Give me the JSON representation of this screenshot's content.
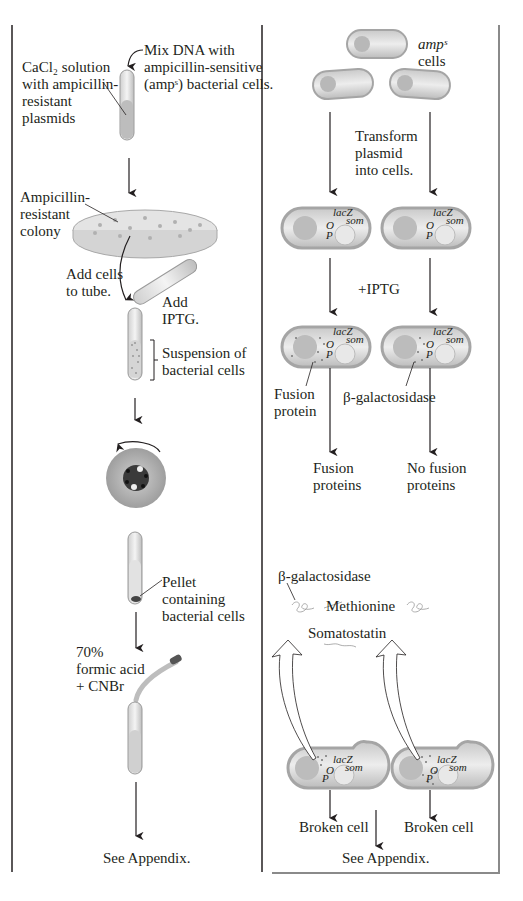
{
  "left_panel": {
    "cacl2_label": [
      "CaCl₂ solution",
      "with ampicillin-",
      "resistant",
      "plasmids"
    ],
    "mix_label": [
      "Mix DNA with",
      "ampicillin-sensitive",
      "(ampˢ) bacterial cells."
    ],
    "colony_label": [
      "Ampicillin-",
      "resistant",
      "colony"
    ],
    "add_cells_label": [
      "Add cells",
      "to tube."
    ],
    "add_iptg_label": [
      "Add",
      "IPTG."
    ],
    "suspension_label": [
      "Suspension of",
      "bacterial cells"
    ],
    "pellet_label": [
      "Pellet",
      "containing",
      "bacterial cells"
    ],
    "formic_label": [
      "70%",
      "formic acid",
      "+ CNBr"
    ],
    "appendix_label": "See Appendix."
  },
  "right_panel": {
    "amps_label": [
      "ampˢ",
      "cells"
    ],
    "transform_label": [
      "Transform",
      "plasmid",
      "into cells."
    ],
    "gene_labels": {
      "lacz": "lacZ",
      "som": "som",
      "o": "O",
      "p": "P"
    },
    "iptg_label": "+IPTG",
    "fusion_protein_label": [
      "Fusion",
      "protein"
    ],
    "bgal_label": "β-galactosidase",
    "fusion_proteins_label": [
      "Fusion",
      "proteins"
    ],
    "no_fusion_label": [
      "No fusion",
      "proteins"
    ],
    "bgal_top_label": "β-galactosidase",
    "methionine_label": "Methionine",
    "somatostatin_label": "Somatostatin",
    "broken_cell_left": "Broken cell",
    "broken_cell_right": "Broken cell",
    "appendix_label": "See Appendix."
  },
  "colors": {
    "line": "#231f20",
    "cell_fill": "#d9d9d9",
    "cell_edge": "#9a9a9a",
    "panel_border": "#8a8a8a"
  }
}
